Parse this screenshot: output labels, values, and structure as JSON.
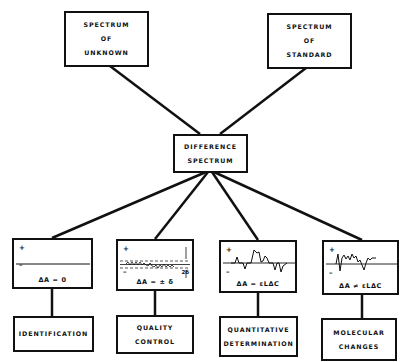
{
  "sources": {
    "unknown": [
      "SPECTRUM",
      "OF",
      "UNKNOWN"
    ],
    "standard": [
      "SPECTRUM",
      "OF",
      "STANDARD"
    ]
  },
  "difference": [
    "DIFFERENCE",
    "SPECTRUM"
  ],
  "spectra": [
    {
      "plus": "+",
      "minus": "–",
      "equation": "ΔA = 0"
    },
    {
      "plus": "+",
      "minus": "–",
      "equation": "ΔA = ± δ",
      "annotation": "2δ"
    },
    {
      "plus": "+",
      "minus": "–",
      "equation": "ΔA = εLΔC"
    },
    {
      "plus": "+",
      "minus": "–",
      "equation": "ΔA ≠ εLΔC"
    }
  ],
  "outcomes": [
    [
      "IDENTIFICATION"
    ],
    [
      "QUALITY",
      "CONTROL"
    ],
    [
      "QUANTITATIVE",
      "DETERMINATION"
    ],
    [
      "MOLECULAR",
      "CHANGES"
    ]
  ],
  "colors": {
    "ink": "#111111",
    "background": "#ffffff"
  }
}
